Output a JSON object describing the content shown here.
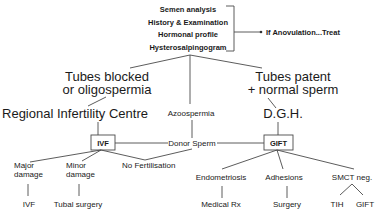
{
  "diagram": {
    "initial_tests": [
      "Semen analysis",
      "History & Examination",
      "Hormonal profile",
      "Hysterosalpingogram"
    ],
    "anovulation": "If Anovulation...Treat",
    "branch_left": {
      "line1": "Tubes blocked",
      "line2": "or oligospermia"
    },
    "branch_right": {
      "line1": "Tubes patent",
      "line2": "+ normal sperm"
    },
    "azoospermia": "Azoospermia",
    "regional_centre": "Regional Infertility Centre",
    "dgh": "D.G.H.",
    "ivf_box": "IVF",
    "donor_sperm": "Donor Sperm",
    "gift_box": "GIFT",
    "ivf_children": {
      "major": {
        "line1": "Major",
        "line2": "damage",
        "outcome": "IVF"
      },
      "minor": {
        "line1": "Minor",
        "line2": "damage",
        "outcome": "Tubal surgery"
      },
      "no_fert": "No Fertilisation"
    },
    "gift_children": {
      "endometriosis": {
        "label": "Endometriosis",
        "outcome": "Medical Rx"
      },
      "adhesions": {
        "label": "Adhesions",
        "outcome": "Surgery"
      },
      "smct": {
        "label": "SMCT neg.",
        "outcome_left": "TIH",
        "outcome_right": "GIFT"
      }
    }
  }
}
